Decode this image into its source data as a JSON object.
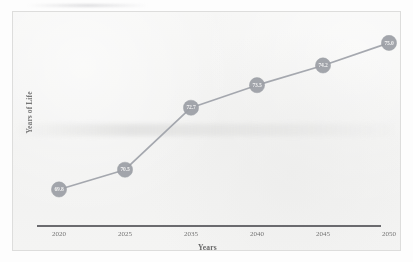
{
  "chart_data": {
    "type": "line",
    "title": "",
    "xlabel": "Years",
    "ylabel": "Years of Life",
    "categories": [
      "2020",
      "2025",
      "2035",
      "2040",
      "2045",
      "2050"
    ],
    "values": [
      69.8,
      70.5,
      72.7,
      73.5,
      74.2,
      75.0
    ],
    "point_labels": [
      "69.8",
      "70.5",
      "72.7",
      "73.5",
      "74.2",
      "75.0"
    ],
    "series": [
      {
        "name": "Years of Life",
        "values": [
          69.8,
          70.5,
          72.7,
          73.5,
          74.2,
          75.0
        ]
      }
    ],
    "ylim": [
      69.0,
      75.6
    ],
    "grid": false,
    "legend": false,
    "legend_position": "none",
    "y_tick_labels": [],
    "marker": "circle",
    "data_labels_inside_markers": true,
    "colors": {
      "line": "#9b9ea6",
      "marker": "#9a9da4",
      "marker_label": "#f2f2f2",
      "axis_rule": "#4e4e52",
      "plot_background": "#f3f3f2",
      "frame_border": "#dcdcdb",
      "axis_text": "#6b6b6b"
    }
  }
}
